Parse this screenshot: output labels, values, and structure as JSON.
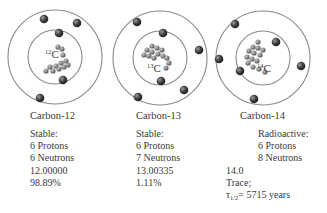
{
  "diagram": {
    "atoms": [
      {
        "name": "Carbon-12",
        "symbol": "C",
        "mass_number": "12",
        "status": "Stable:",
        "protons": "6 Protons",
        "neutrons": "6 Neutrons",
        "mass": "12.00000",
        "abundance": "98.89%"
      },
      {
        "name": "Carbon-13",
        "symbol": "C",
        "mass_number": "13",
        "status": "Stable:",
        "protons": "6 Protons",
        "neutrons": "7 Neutrons",
        "mass": "13.00335",
        "abundance": "1.11%"
      },
      {
        "name": "Carbon-14",
        "symbol": "C",
        "mass_number": "14",
        "status": "Radioactive:",
        "protons": "6 Protons",
        "neutrons": "8 Neutrons",
        "mass": "14.0",
        "abundance": "Trace;",
        "half_life_symbol": "τ",
        "half_life_subscript": "1/2",
        "half_life_value": "= 5715 years"
      }
    ],
    "colors": {
      "orbit": "#8a8a8a",
      "electron": "#3a3a3a",
      "nucleon": "#7a7a7a",
      "text": "#3a3a3a"
    }
  }
}
